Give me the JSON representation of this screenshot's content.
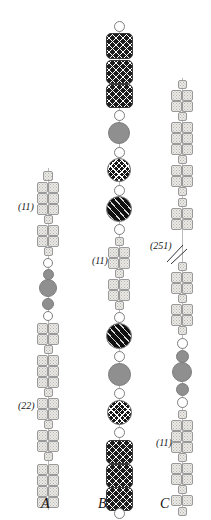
{
  "figure": {
    "background_color": "#ffffff",
    "width": 211,
    "height": 520
  },
  "palette": {
    "stipple_light": "#eceae6",
    "outline_light": "#9a9a9a",
    "white": "#ffffff",
    "gray": "#8f8f8f",
    "black": "#121212",
    "cross_hatch": "#161616",
    "diagonal_hatch": "#111111"
  },
  "legend_keys": [
    {
      "name": "paired-stippled-square",
      "meaning": "paired stippled chromomere"
    },
    {
      "name": "single-stippled-square",
      "meaning": "single stippled chromomere"
    },
    {
      "name": "white-circle",
      "meaning": "unstained knob"
    },
    {
      "name": "gray-circle",
      "meaning": "grey heterochromatic knob"
    },
    {
      "name": "cross-hatched-circle",
      "meaning": "cross-hatched knob"
    },
    {
      "name": "diagonal-hatched-circle",
      "meaning": "diagonally hatched knob"
    },
    {
      "name": "cross-hatched-block",
      "meaning": "cross-hatched block segment"
    }
  ],
  "panels": [
    {
      "id": "A",
      "letter": "A",
      "letter_x": 41,
      "letter_y": 496,
      "axis_x": 48,
      "axis_top": 168,
      "axis_bottom": 510,
      "annotations": [
        {
          "text": "(11)",
          "x": 18,
          "y": 201
        },
        {
          "text": "(22)",
          "x": 18,
          "y": 400
        }
      ],
      "elements": [
        {
          "type": "square",
          "fill": "stipple",
          "cy": 176,
          "w": 10,
          "h": 10
        },
        {
          "type": "pair",
          "fill": "stipple",
          "cy": 187,
          "w": 11,
          "h": 11
        },
        {
          "type": "pair",
          "fill": "stipple",
          "cy": 198,
          "w": 11,
          "h": 11
        },
        {
          "type": "pair",
          "fill": "stipple",
          "cy": 209,
          "w": 11,
          "h": 11
        },
        {
          "type": "square",
          "fill": "stipple",
          "cy": 219,
          "w": 9,
          "h": 9
        },
        {
          "type": "pair",
          "fill": "stipple",
          "cy": 230,
          "w": 11,
          "h": 11
        },
        {
          "type": "pair",
          "fill": "stipple",
          "cy": 241,
          "w": 11,
          "h": 11
        },
        {
          "type": "square",
          "fill": "stipple",
          "cy": 251,
          "w": 9,
          "h": 9
        },
        {
          "type": "circle",
          "fill": "white",
          "cy": 263,
          "d": 10
        },
        {
          "type": "circle",
          "fill": "gray",
          "cy": 274,
          "d": 11
        },
        {
          "type": "circle",
          "fill": "gray",
          "cy": 288,
          "d": 18
        },
        {
          "type": "circle",
          "fill": "gray",
          "cy": 304,
          "d": 12
        },
        {
          "type": "circle",
          "fill": "white",
          "cy": 316,
          "d": 10
        },
        {
          "type": "pair",
          "fill": "stipple",
          "cy": 328,
          "w": 11,
          "h": 11
        },
        {
          "type": "pair",
          "fill": "stipple",
          "cy": 339,
          "w": 11,
          "h": 11
        },
        {
          "type": "square",
          "fill": "stipple",
          "cy": 349,
          "w": 9,
          "h": 9
        },
        {
          "type": "pair",
          "fill": "stipple",
          "cy": 360,
          "w": 11,
          "h": 11
        },
        {
          "type": "pair",
          "fill": "stipple",
          "cy": 371,
          "w": 11,
          "h": 11
        },
        {
          "type": "pair",
          "fill": "stipple",
          "cy": 382,
          "w": 11,
          "h": 11
        },
        {
          "type": "square",
          "fill": "stipple",
          "cy": 392,
          "w": 9,
          "h": 9
        },
        {
          "type": "pair",
          "fill": "stipple",
          "cy": 403,
          "w": 11,
          "h": 11
        },
        {
          "type": "pair",
          "fill": "stipple",
          "cy": 414,
          "w": 11,
          "h": 11
        },
        {
          "type": "square",
          "fill": "stipple",
          "cy": 424,
          "w": 9,
          "h": 9
        },
        {
          "type": "pair",
          "fill": "stipple",
          "cy": 435,
          "w": 11,
          "h": 11
        },
        {
          "type": "pair",
          "fill": "stipple",
          "cy": 446,
          "w": 11,
          "h": 11
        },
        {
          "type": "square",
          "fill": "stipple",
          "cy": 456,
          "w": 9,
          "h": 9
        },
        {
          "type": "pair",
          "fill": "stipple",
          "cy": 469,
          "w": 11,
          "h": 11
        },
        {
          "type": "pair",
          "fill": "stipple",
          "cy": 480,
          "w": 11,
          "h": 11
        },
        {
          "type": "pair",
          "fill": "stipple",
          "cy": 491,
          "w": 11,
          "h": 11
        },
        {
          "type": "pair",
          "fill": "stipple",
          "cy": 502,
          "w": 11,
          "h": 11
        }
      ]
    },
    {
      "id": "B",
      "letter": "B",
      "letter_x": 98,
      "letter_y": 496,
      "axis_x": 119,
      "axis_top": 22,
      "axis_bottom": 512,
      "annotations": [
        {
          "text": "(11)",
          "x": 92,
          "y": 255
        }
      ],
      "elements": [
        {
          "type": "circle",
          "fill": "white",
          "cy": 26,
          "d": 11
        },
        {
          "type": "block",
          "fill": "xhatch2",
          "cy": 46,
          "w": 27,
          "h": 26
        },
        {
          "type": "block",
          "fill": "xhatch2",
          "cy": 72,
          "w": 27,
          "h": 24
        },
        {
          "type": "block",
          "fill": "xhatch2",
          "cy": 96,
          "w": 27,
          "h": 24
        },
        {
          "type": "circle",
          "fill": "white",
          "cy": 115,
          "d": 11
        },
        {
          "type": "circle",
          "fill": "gray",
          "cy": 133,
          "d": 22
        },
        {
          "type": "circle",
          "fill": "white",
          "cy": 152,
          "d": 11
        },
        {
          "type": "circle",
          "fill": "xhatch",
          "cy": 170,
          "d": 24
        },
        {
          "type": "circle",
          "fill": "white",
          "cy": 190,
          "d": 11
        },
        {
          "type": "circle",
          "fill": "dhatch",
          "cy": 209,
          "d": 26
        },
        {
          "type": "circle",
          "fill": "white",
          "cy": 229,
          "d": 11
        },
        {
          "type": "square",
          "fill": "stipple",
          "cy": 241,
          "w": 9,
          "h": 9
        },
        {
          "type": "pair",
          "fill": "stipple",
          "cy": 252,
          "w": 11,
          "h": 11
        },
        {
          "type": "pair",
          "fill": "stipple",
          "cy": 263,
          "w": 11,
          "h": 11
        },
        {
          "type": "square",
          "fill": "stipple",
          "cy": 273,
          "w": 9,
          "h": 9
        },
        {
          "type": "pair",
          "fill": "stipple",
          "cy": 284,
          "w": 11,
          "h": 11
        },
        {
          "type": "pair",
          "fill": "stipple",
          "cy": 295,
          "w": 11,
          "h": 11
        },
        {
          "type": "square",
          "fill": "stipple",
          "cy": 305,
          "w": 9,
          "h": 9
        },
        {
          "type": "circle",
          "fill": "white",
          "cy": 317,
          "d": 11
        },
        {
          "type": "circle",
          "fill": "dhatch",
          "cy": 336,
          "d": 26
        },
        {
          "type": "circle",
          "fill": "white",
          "cy": 356,
          "d": 11
        },
        {
          "type": "circle",
          "fill": "gray",
          "cy": 374,
          "d": 23
        },
        {
          "type": "circle",
          "fill": "white",
          "cy": 393,
          "d": 11
        },
        {
          "type": "circle",
          "fill": "xhatch",
          "cy": 412,
          "d": 25
        },
        {
          "type": "circle",
          "fill": "white",
          "cy": 432,
          "d": 11
        },
        {
          "type": "block",
          "fill": "xhatch2",
          "cy": 452,
          "w": 27,
          "h": 24
        },
        {
          "type": "block",
          "fill": "xhatch2",
          "cy": 476,
          "w": 27,
          "h": 24
        },
        {
          "type": "block",
          "fill": "xhatch2",
          "cy": 499,
          "w": 27,
          "h": 24
        },
        {
          "type": "circle",
          "fill": "white",
          "cy": 513,
          "d": 11
        }
      ]
    },
    {
      "id": "C",
      "letter": "C",
      "letter_x": 160,
      "letter_y": 496,
      "axis_x": 182,
      "axis_top": 78,
      "axis_bottom": 512,
      "annotations": [
        {
          "text": "(251)",
          "x": 150,
          "y": 240
        },
        {
          "text": "(11)",
          "x": 156,
          "y": 437
        }
      ],
      "break_mark": {
        "x": 166,
        "y": 243,
        "w": 22,
        "h": 22
      },
      "elements": [
        {
          "type": "square",
          "fill": "stipple",
          "cy": 84,
          "w": 9,
          "h": 9
        },
        {
          "type": "pair",
          "fill": "stipple",
          "cy": 95,
          "w": 11,
          "h": 11
        },
        {
          "type": "pair",
          "fill": "stipple",
          "cy": 106,
          "w": 11,
          "h": 11
        },
        {
          "type": "square",
          "fill": "stipple",
          "cy": 116,
          "w": 9,
          "h": 9
        },
        {
          "type": "pair",
          "fill": "stipple",
          "cy": 127,
          "w": 11,
          "h": 11
        },
        {
          "type": "pair",
          "fill": "stipple",
          "cy": 138,
          "w": 11,
          "h": 11
        },
        {
          "type": "pair",
          "fill": "stipple",
          "cy": 149,
          "w": 11,
          "h": 11
        },
        {
          "type": "square",
          "fill": "stipple",
          "cy": 159,
          "w": 9,
          "h": 9
        },
        {
          "type": "pair",
          "fill": "stipple",
          "cy": 170,
          "w": 11,
          "h": 11
        },
        {
          "type": "pair",
          "fill": "stipple",
          "cy": 181,
          "w": 11,
          "h": 11
        },
        {
          "type": "square",
          "fill": "stipple",
          "cy": 191,
          "w": 9,
          "h": 9
        },
        {
          "type": "square",
          "fill": "stipple",
          "cy": 202,
          "w": 9,
          "h": 9
        },
        {
          "type": "pair",
          "fill": "stipple",
          "cy": 213,
          "w": 11,
          "h": 11
        },
        {
          "type": "pair",
          "fill": "stipple",
          "cy": 224,
          "w": 11,
          "h": 11
        },
        {
          "type": "square",
          "fill": "stipple",
          "cy": 266,
          "w": 9,
          "h": 9
        },
        {
          "type": "pair",
          "fill": "stipple",
          "cy": 277,
          "w": 11,
          "h": 11
        },
        {
          "type": "pair",
          "fill": "stipple",
          "cy": 288,
          "w": 11,
          "h": 11
        },
        {
          "type": "square",
          "fill": "stipple",
          "cy": 298,
          "w": 9,
          "h": 9
        },
        {
          "type": "pair",
          "fill": "stipple",
          "cy": 309,
          "w": 11,
          "h": 11
        },
        {
          "type": "pair",
          "fill": "stipple",
          "cy": 320,
          "w": 11,
          "h": 11
        },
        {
          "type": "square",
          "fill": "stipple",
          "cy": 330,
          "w": 9,
          "h": 9
        },
        {
          "type": "circle",
          "fill": "white",
          "cy": 343,
          "d": 11
        },
        {
          "type": "circle",
          "fill": "gray",
          "cy": 356,
          "d": 13
        },
        {
          "type": "circle",
          "fill": "gray",
          "cy": 372,
          "d": 20
        },
        {
          "type": "circle",
          "fill": "gray",
          "cy": 389,
          "d": 13
        },
        {
          "type": "circle",
          "fill": "white",
          "cy": 402,
          "d": 11
        },
        {
          "type": "square",
          "fill": "stipple",
          "cy": 414,
          "w": 9,
          "h": 9
        },
        {
          "type": "pair",
          "fill": "stipple",
          "cy": 425,
          "w": 11,
          "h": 11
        },
        {
          "type": "pair",
          "fill": "stipple",
          "cy": 436,
          "w": 11,
          "h": 11
        },
        {
          "type": "pair",
          "fill": "stipple",
          "cy": 447,
          "w": 11,
          "h": 11
        },
        {
          "type": "square",
          "fill": "stipple",
          "cy": 457,
          "w": 9,
          "h": 9
        },
        {
          "type": "pair",
          "fill": "stipple",
          "cy": 468,
          "w": 11,
          "h": 11
        },
        {
          "type": "pair",
          "fill": "stipple",
          "cy": 479,
          "w": 11,
          "h": 11
        },
        {
          "type": "square",
          "fill": "stipple",
          "cy": 489,
          "w": 9,
          "h": 9
        },
        {
          "type": "pair",
          "fill": "stipple",
          "cy": 500,
          "w": 11,
          "h": 11
        },
        {
          "type": "square",
          "fill": "stipple",
          "cy": 511,
          "w": 9,
          "h": 9
        }
      ]
    }
  ]
}
